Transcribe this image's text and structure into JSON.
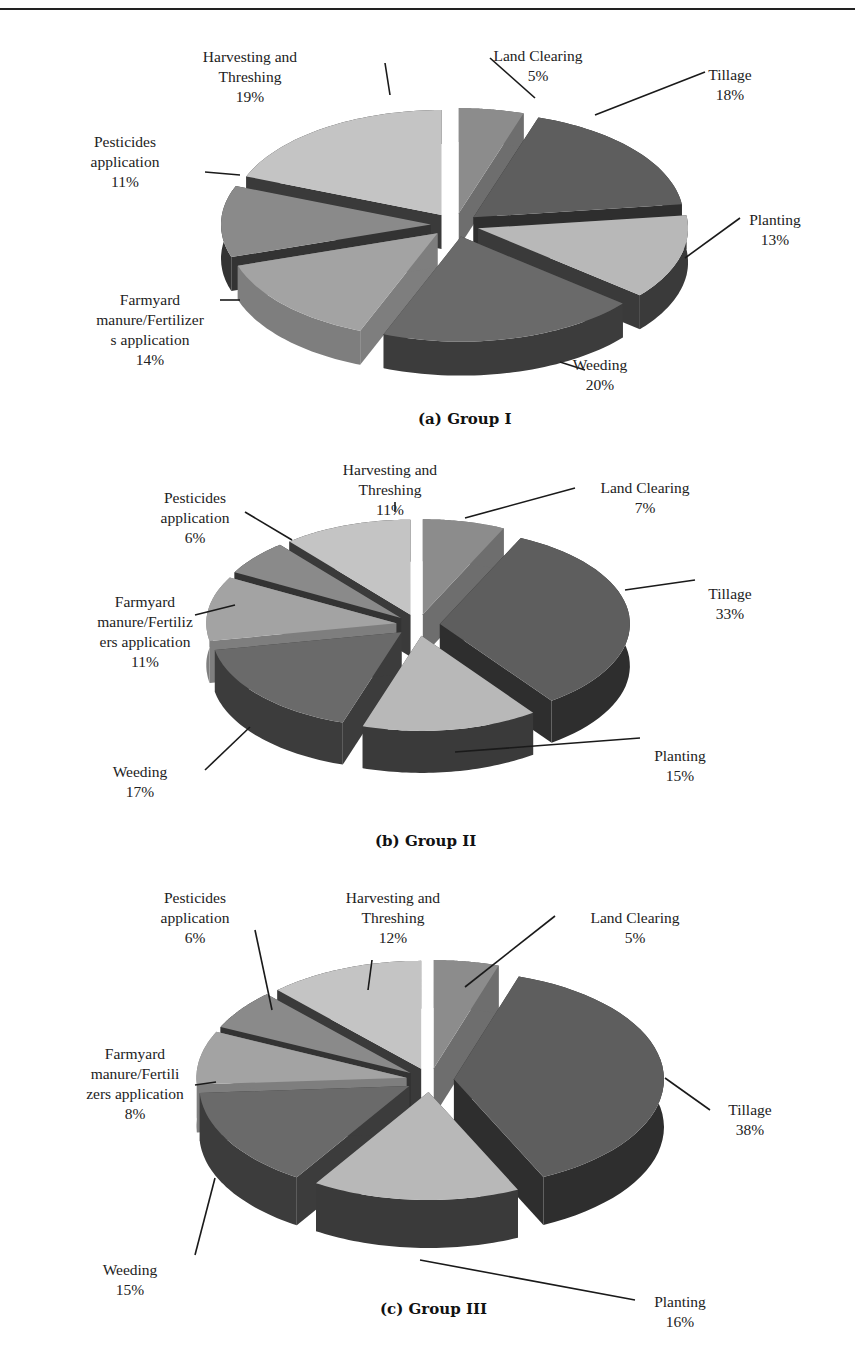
{
  "chart_data": [
    {
      "type": "pie",
      "title": "(a) Group I",
      "style": "3d-exploded",
      "categories": [
        "Land Clearing",
        "Tillage",
        "Planting",
        "Weeding",
        "Farmyard manure/Fertilizers application",
        "Pesticides application",
        "Harvesting and Threshing"
      ],
      "values": [
        5,
        18,
        13,
        20,
        14,
        11,
        19
      ],
      "labels": [
        {
          "lines": [
            "Land Clearing",
            "5%"
          ]
        },
        {
          "lines": [
            "Tillage",
            "18%"
          ]
        },
        {
          "lines": [
            "Planting",
            "13%"
          ]
        },
        {
          "lines": [
            "Weeding",
            "20%"
          ]
        },
        {
          "lines": [
            "Farmyard",
            "manure/Fertilizer",
            "s application",
            "14%"
          ]
        },
        {
          "lines": [
            "Pesticides",
            "application",
            "11%"
          ]
        },
        {
          "lines": [
            "Harvesting and",
            "Threshing",
            "19%"
          ]
        }
      ],
      "unit": "%"
    },
    {
      "type": "pie",
      "title": "(b) Group II",
      "style": "3d-exploded",
      "categories": [
        "Land Clearing",
        "Tillage",
        "Planting",
        "Weeding",
        "Farmyard manure/Fertilizers application",
        "Pesticides application",
        "Harvesting and Threshing"
      ],
      "values": [
        7,
        33,
        15,
        17,
        11,
        6,
        11
      ],
      "labels": [
        {
          "lines": [
            "Land Clearing",
            "7%"
          ]
        },
        {
          "lines": [
            "Tillage",
            "33%"
          ]
        },
        {
          "lines": [
            "Planting",
            "15%"
          ]
        },
        {
          "lines": [
            "Weeding",
            "17%"
          ]
        },
        {
          "lines": [
            "Farmyard",
            "manure/Fertiliz",
            "ers application",
            "11%"
          ]
        },
        {
          "lines": [
            "Pesticides",
            "application",
            "6%"
          ]
        },
        {
          "lines": [
            "Harvesting and",
            "Threshing",
            "11%"
          ]
        }
      ],
      "unit": "%"
    },
    {
      "type": "pie",
      "title": "(c) Group III",
      "style": "3d-exploded",
      "categories": [
        "Land Clearing",
        "Tillage",
        "Planting",
        "Weeding",
        "Farmyard manure/Fertilizers application",
        "Pesticides application",
        "Harvesting and Threshing"
      ],
      "values": [
        5,
        38,
        16,
        15,
        8,
        6,
        12
      ],
      "labels": [
        {
          "lines": [
            "Land Clearing",
            "5%"
          ]
        },
        {
          "lines": [
            "Tillage",
            "38%"
          ]
        },
        {
          "lines": [
            "Planting",
            "16%"
          ]
        },
        {
          "lines": [
            "Weeding",
            "15%"
          ]
        },
        {
          "lines": [
            "Farmyard",
            "manure/Fertili",
            "zers application",
            "8%"
          ]
        },
        {
          "lines": [
            "Pesticides",
            "application",
            "6%"
          ]
        },
        {
          "lines": [
            "Harvesting and",
            "Threshing",
            "12%"
          ]
        }
      ],
      "unit": "%"
    }
  ],
  "slice_colors": {
    "top": [
      "#8c8c8c",
      "#5e5e5e",
      "#b8b8b8",
      "#6a6a6a",
      "#a3a3a3",
      "#8a8a8a",
      "#c4c4c4"
    ],
    "side": [
      "#6e6e6e",
      "#2e2e2e",
      "#3a3a3a",
      "#3c3c3c",
      "#7e7e7e",
      "#333333",
      "#3a3a3a"
    ]
  }
}
